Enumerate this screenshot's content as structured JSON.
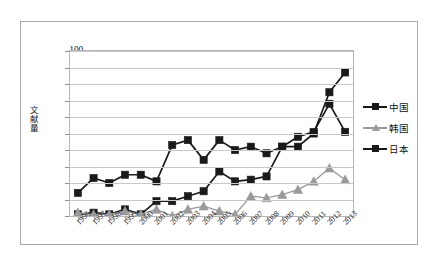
{
  "chart_data": {
    "type": "line",
    "title": "",
    "subtitle": "",
    "xlabel": "",
    "ylabel": "文献量",
    "ylim": [
      0,
      100
    ],
    "ytick_step": 10,
    "yticks": [
      "0",
      "10",
      "20",
      "30",
      "40",
      "50",
      "60",
      "70",
      "80",
      "90",
      "100"
    ],
    "grid": true,
    "grid_axis": "y",
    "legend_position": "right",
    "categories": [
      "1996",
      "1997",
      "1998",
      "1999",
      "2000",
      "2001",
      "2002",
      "2003",
      "2004",
      "2005",
      "2006",
      "2007",
      "2008",
      "2009",
      "2010",
      "2011",
      "2012",
      "2013"
    ],
    "series": [
      {
        "name": "中国",
        "color": "#1a1a1a",
        "marker": "square",
        "values": [
          1,
          2,
          1,
          4,
          1,
          9,
          9,
          12,
          15,
          27,
          21,
          22,
          24,
          42,
          42,
          50,
          75,
          87
        ]
      },
      {
        "name": "韩国",
        "color": "#9a9a9a",
        "marker": "triangle",
        "values": [
          2,
          1,
          1,
          3,
          1,
          4,
          0,
          4,
          6,
          3,
          1,
          12,
          11,
          13,
          16,
          21,
          29,
          22
        ]
      },
      {
        "name": "日本",
        "color": "#1a1a1a",
        "marker": "square",
        "values": [
          14,
          23,
          20,
          25,
          25,
          21,
          43,
          46,
          34,
          46,
          40,
          42,
          38,
          42,
          48,
          51,
          68,
          51
        ]
      }
    ]
  },
  "legend": {
    "items": [
      {
        "label": "中国",
        "color": "#1a1a1a",
        "marker": "square"
      },
      {
        "label": "韩国",
        "color": "#9a9a9a",
        "marker": "triangle"
      },
      {
        "label": "日本",
        "color": "#1a1a1a",
        "marker": "square"
      }
    ]
  },
  "axes": {
    "y_label": "文献量",
    "y_max": 100,
    "y_min": 0
  }
}
